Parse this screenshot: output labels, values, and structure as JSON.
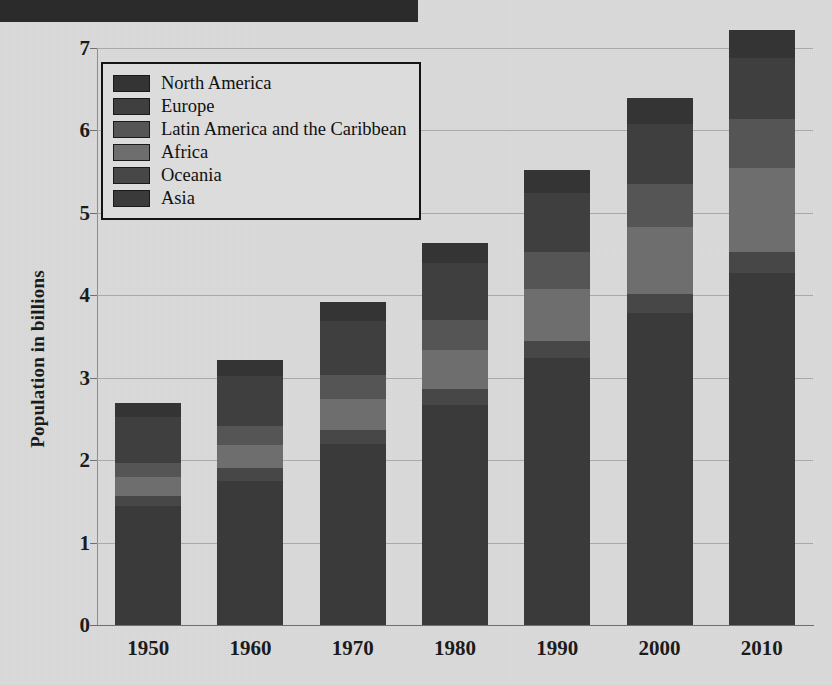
{
  "header": {
    "bar_color": "#2b2b2b"
  },
  "chart_data": {
    "type": "bar",
    "stacked": true,
    "title": "",
    "xlabel": "",
    "ylabel": "Population in billions",
    "categories": [
      "1950",
      "1960",
      "1970",
      "1980",
      "1990",
      "2000",
      "2010"
    ],
    "ylim": [
      0,
      7
    ],
    "yticks": [
      0,
      1,
      2,
      3,
      4,
      5,
      6,
      7
    ],
    "ytick_labels": [
      "0",
      "1",
      "2",
      "3",
      "4",
      "5",
      "6",
      "7"
    ],
    "grid": true,
    "legend_position": "upper-left",
    "series": [
      {
        "name": "Asia",
        "color": "#3a3a3a",
        "values": [
          1.44,
          1.75,
          2.2,
          2.67,
          3.24,
          3.78,
          4.27
        ]
      },
      {
        "name": "Oceania",
        "color": "#474747",
        "values": [
          0.13,
          0.15,
          0.17,
          0.19,
          0.21,
          0.23,
          0.25
        ]
      },
      {
        "name": "Africa",
        "color": "#6e6e6e",
        "values": [
          0.23,
          0.29,
          0.37,
          0.48,
          0.63,
          0.82,
          1.03
        ]
      },
      {
        "name": "Latin America and the Caribbean",
        "color": "#555555",
        "values": [
          0.17,
          0.22,
          0.29,
          0.36,
          0.44,
          0.52,
          0.59
        ]
      },
      {
        "name": "Europe",
        "color": "#3f3f3f",
        "values": [
          0.55,
          0.61,
          0.66,
          0.69,
          0.72,
          0.73,
          0.74
        ]
      },
      {
        "name": "North America",
        "color": "#343434",
        "values": [
          0.17,
          0.2,
          0.23,
          0.25,
          0.28,
          0.31,
          0.34
        ]
      }
    ],
    "totals": [
      2.45,
      3.05,
      3.72,
      4.5,
      5.35,
      6.2,
      6.97
    ],
    "legend_order": [
      "North America",
      "Europe",
      "Latin America and the Caribbean",
      "Africa",
      "Oceania",
      "Asia"
    ]
  }
}
